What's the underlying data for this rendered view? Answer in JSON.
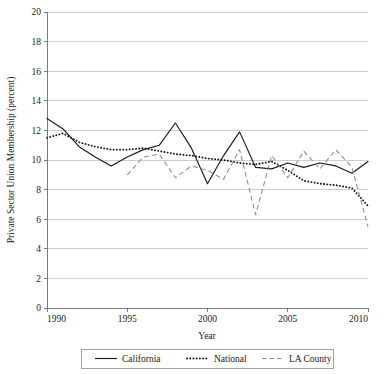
{
  "chart_data": {
    "type": "line",
    "title": "",
    "xlabel": "Year",
    "ylabel": "Private Sector Union Membership (percent)",
    "xlim": [
      1990,
      2010
    ],
    "ylim": [
      0,
      20
    ],
    "xticks": [
      1990,
      1995,
      2000,
      2005,
      2010
    ],
    "xtick_labels": [
      "1990",
      "1995",
      "2000",
      "2005",
      "2010"
    ],
    "yticks": [
      0,
      2,
      4,
      6,
      8,
      10,
      12,
      14,
      16,
      18,
      20
    ],
    "ytick_labels": [
      "0",
      "2",
      "4",
      "6",
      "8",
      "10",
      "12",
      "14",
      "16",
      "18",
      "20"
    ],
    "grid": true,
    "grid_axis": "y",
    "legend_position": "below-axis",
    "x": [
      1990,
      1991,
      1992,
      1993,
      1994,
      1995,
      1996,
      1997,
      1998,
      1999,
      2000,
      2001,
      2002,
      2003,
      2004,
      2005,
      2006,
      2007,
      2008,
      2009,
      2010
    ],
    "series": [
      {
        "name": "California",
        "style": "solid",
        "color": "#1a1a1a",
        "x": [
          1990,
          1991,
          1992,
          1993,
          1994,
          1995,
          1996,
          1997,
          1998,
          1999,
          2000,
          2001,
          2002,
          2003,
          2004,
          2005,
          2006,
          2007,
          2008,
          2009,
          2010
        ],
        "values": [
          12.8,
          12.1,
          10.9,
          10.2,
          9.6,
          10.2,
          10.7,
          11.0,
          12.5,
          10.8,
          8.4,
          10.3,
          11.9,
          9.5,
          9.4,
          9.8,
          9.5,
          9.8,
          9.6,
          9.1,
          9.9
        ]
      },
      {
        "name": "National",
        "style": "dotted",
        "color": "#1a1a1a",
        "x": [
          1990,
          1991,
          1992,
          1993,
          1994,
          1995,
          1996,
          1997,
          1998,
          1999,
          2000,
          2001,
          2002,
          2003,
          2004,
          2005,
          2006,
          2007,
          2008,
          2009,
          2010
        ],
        "values": [
          11.5,
          11.8,
          11.2,
          10.9,
          10.7,
          10.7,
          10.8,
          10.6,
          10.4,
          10.3,
          10.1,
          10.0,
          9.8,
          9.7,
          9.9,
          9.3,
          8.6,
          8.4,
          8.3,
          8.1,
          6.9
        ]
      },
      {
        "name": "LA County",
        "style": "dashed",
        "color": "#8e8e8e",
        "x": [
          1995,
          1996,
          1997,
          1998,
          1999,
          2000,
          2001,
          2002,
          2003,
          2004,
          2005,
          2006,
          2007,
          2008,
          2009,
          2010
        ],
        "values": [
          9.0,
          10.2,
          10.4,
          8.8,
          9.6,
          9.3,
          8.7,
          10.7,
          6.3,
          10.3,
          8.8,
          10.6,
          9.4,
          10.7,
          9.5,
          5.5
        ]
      }
    ]
  },
  "axes": {
    "y_title": "Private Sector Union Membership (percent)",
    "x_title": "Year"
  },
  "legend": {
    "items": [
      {
        "label": "California",
        "style": "solid"
      },
      {
        "label": "National",
        "style": "dotted"
      },
      {
        "label": "LA County",
        "style": "dashed"
      }
    ]
  }
}
